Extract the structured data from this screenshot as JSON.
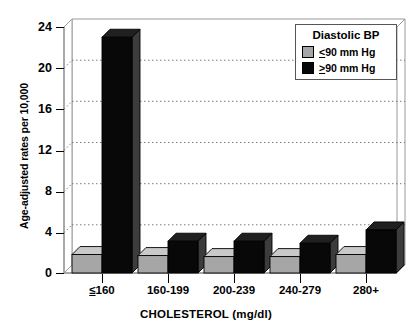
{
  "chart_data": {
    "type": "bar",
    "title": "",
    "xlabel": "CHOLESTEROL (mg/dl)",
    "ylabel": "Age-adjusted rates per 10,000",
    "categories": [
      "<160",
      "160-199",
      "200-239",
      "240-279",
      "280+"
    ],
    "ylim": [
      0,
      24
    ],
    "yticks": [
      0,
      4,
      8,
      12,
      16,
      20,
      24
    ],
    "ytick_labels": [
      "0",
      "4",
      "8",
      "12",
      "16",
      "20",
      "24"
    ],
    "grid": true,
    "grid_style": "dotted-horizontal",
    "legend_position": "top-right",
    "legend_title": "Diastolic BP",
    "series": [
      {
        "name": "<90 mm Hg",
        "color": "#a6a6a6",
        "values": [
          1.8,
          1.7,
          1.6,
          1.6,
          1.8
        ]
      },
      {
        "name": ">90 mm Hg",
        "color": "#070707",
        "values": [
          23.0,
          3.1,
          3.1,
          2.9,
          4.2
        ]
      }
    ]
  },
  "axes": {
    "y_title": "Age-adjusted rates per 10,000",
    "x_title": "CHOLESTEROL (mg/dl)",
    "y_tick_labels": [
      "24",
      "20",
      "16",
      "12",
      "8",
      "4",
      "0"
    ],
    "x_tick_labels": [
      {
        "prefix": "≤",
        "rest": "160",
        "underline_prefix": true
      },
      {
        "prefix": "",
        "rest": "160-199",
        "underline_prefix": false
      },
      {
        "prefix": "",
        "rest": "200-239",
        "underline_prefix": false
      },
      {
        "prefix": "",
        "rest": "240-279",
        "underline_prefix": false
      },
      {
        "prefix": "",
        "rest": "280+",
        "underline_prefix": false
      }
    ]
  },
  "legend": {
    "title": "Diastolic BP",
    "items": [
      {
        "symbol": "<",
        "text": "90 mm Hg",
        "swatch": "#a6a6a6",
        "name": "legend-item-below-90"
      },
      {
        "symbol": ">",
        "text": "90 mm Hg",
        "swatch": "#070707",
        "name": "legend-item-above-90"
      }
    ]
  },
  "colors": {
    "series_low": "#a6a6a6",
    "series_high": "#070707",
    "frame": "#9a9a9a",
    "grid": "#888888",
    "text": "#000000",
    "background": "#ffffff"
  }
}
